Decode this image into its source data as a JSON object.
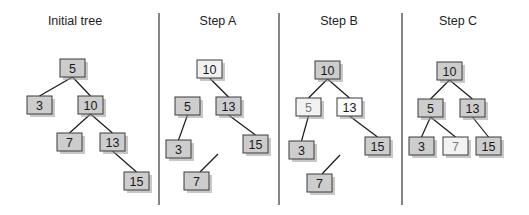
{
  "diagram": {
    "colors": {
      "node_default_fill": "#cdcdcd",
      "node_light_fill": "#f2f2f2",
      "node_white_fill": "#fbfbfb",
      "text_default": "#1a1a1a",
      "text_faded": "#7a7a7a",
      "divider": "#444444",
      "edge": "#1a1a1a"
    },
    "node_size": {
      "w": 25,
      "h": 18
    },
    "dividers": [
      {
        "x": 159,
        "y1": 13,
        "y2": 205
      },
      {
        "x": 279,
        "y1": 13,
        "y2": 205
      },
      {
        "x": 402,
        "y1": 13,
        "y2": 205
      }
    ],
    "panels": [
      {
        "id": "initial",
        "title": "Initial tree",
        "title_x": 75,
        "title_y": 25,
        "nodes": [
          {
            "id": "n5",
            "label": "5",
            "x": 60,
            "y": 59,
            "style": "default"
          },
          {
            "id": "n3",
            "label": "3",
            "x": 27,
            "y": 96,
            "style": "default"
          },
          {
            "id": "n10",
            "label": "10",
            "x": 78,
            "y": 96,
            "style": "default"
          },
          {
            "id": "n7",
            "label": "7",
            "x": 57,
            "y": 133,
            "style": "default"
          },
          {
            "id": "n13",
            "label": "13",
            "x": 100,
            "y": 133,
            "style": "default"
          },
          {
            "id": "n15",
            "label": "15",
            "x": 124,
            "y": 172,
            "style": "default"
          }
        ],
        "edges": [
          {
            "from": "n5",
            "to": "n3"
          },
          {
            "from": "n5",
            "to": "n10"
          },
          {
            "from": "n10",
            "to": "n7"
          },
          {
            "from": "n10",
            "to": "n13"
          },
          {
            "from": "n13",
            "to": "n15"
          }
        ],
        "loose_edges": []
      },
      {
        "id": "step-a",
        "title": "Step A",
        "title_x": 218,
        "title_y": 25,
        "nodes": [
          {
            "id": "n10",
            "label": "10",
            "x": 197,
            "y": 60,
            "style": "light"
          },
          {
            "id": "n5",
            "label": "5",
            "x": 175,
            "y": 97,
            "style": "default"
          },
          {
            "id": "n13",
            "label": "13",
            "x": 216,
            "y": 97,
            "style": "default"
          },
          {
            "id": "n3",
            "label": "3",
            "x": 166,
            "y": 140,
            "style": "default"
          },
          {
            "id": "n15",
            "label": "15",
            "x": 243,
            "y": 135,
            "style": "default"
          },
          {
            "id": "n7",
            "label": "7",
            "x": 184,
            "y": 172,
            "style": "default"
          }
        ],
        "edges": [
          {
            "from": "n10",
            "to": "n13"
          },
          {
            "from": "n5",
            "to": "n3"
          },
          {
            "from": "n13",
            "to": "n15"
          }
        ],
        "loose_edges": [
          {
            "x1": 218,
            "y1": 154,
            "x2": 200,
            "y2": 172
          }
        ]
      },
      {
        "id": "step-b",
        "title": "Step B",
        "title_x": 339,
        "title_y": 25,
        "nodes": [
          {
            "id": "n10",
            "label": "10",
            "x": 315,
            "y": 61,
            "style": "default"
          },
          {
            "id": "n5",
            "label": "5",
            "x": 296,
            "y": 98,
            "style": "faded"
          },
          {
            "id": "n13",
            "label": "13",
            "x": 337,
            "y": 98,
            "style": "white"
          },
          {
            "id": "n3",
            "label": "3",
            "x": 289,
            "y": 141,
            "style": "default"
          },
          {
            "id": "n15",
            "label": "15",
            "x": 365,
            "y": 137,
            "style": "default"
          },
          {
            "id": "n7",
            "label": "7",
            "x": 307,
            "y": 174,
            "style": "default"
          }
        ],
        "edges": [
          {
            "from": "n10",
            "to": "n5"
          },
          {
            "from": "n10",
            "to": "n13"
          },
          {
            "from": "n5",
            "to": "n3"
          },
          {
            "from": "n13",
            "to": "n15"
          }
        ],
        "loose_edges": [
          {
            "x1": 340,
            "y1": 155,
            "x2": 322,
            "y2": 174
          }
        ]
      },
      {
        "id": "step-c",
        "title": "Step C",
        "title_x": 458,
        "title_y": 25,
        "nodes": [
          {
            "id": "n10",
            "label": "10",
            "x": 437,
            "y": 62,
            "style": "default"
          },
          {
            "id": "n5",
            "label": "5",
            "x": 418,
            "y": 99,
            "style": "default"
          },
          {
            "id": "n13",
            "label": "13",
            "x": 460,
            "y": 99,
            "style": "default"
          },
          {
            "id": "n3",
            "label": "3",
            "x": 409,
            "y": 137,
            "style": "default"
          },
          {
            "id": "n7",
            "label": "7",
            "x": 443,
            "y": 137,
            "style": "faded"
          },
          {
            "id": "n15",
            "label": "15",
            "x": 476,
            "y": 137,
            "style": "default"
          }
        ],
        "edges": [
          {
            "from": "n10",
            "to": "n5"
          },
          {
            "from": "n10",
            "to": "n13"
          },
          {
            "from": "n5",
            "to": "n3"
          },
          {
            "from": "n5",
            "to": "n7"
          },
          {
            "from": "n13",
            "to": "n15"
          }
        ],
        "loose_edges": []
      }
    ]
  }
}
